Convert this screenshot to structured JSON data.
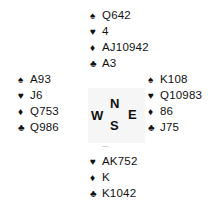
{
  "suits": {
    "spades": "♠",
    "hearts": "♥",
    "diamonds": "♦",
    "clubs": "♣"
  },
  "north": {
    "spades": "Q642",
    "hearts": "4",
    "diamonds": "AJ10942",
    "clubs": "A3"
  },
  "west": {
    "spades": "A93",
    "hearts": "J6",
    "diamonds": "Q753",
    "clubs": "Q986"
  },
  "east": {
    "spades": "K108",
    "hearts": "Q10983",
    "diamonds": "86",
    "clubs": "J75"
  },
  "south": {
    "spades": "–",
    "hearts": "AK752",
    "diamonds": "K",
    "clubs": "K1042"
  },
  "compass": {
    "n": "N",
    "s": "S",
    "e": "E",
    "w": "W"
  }
}
